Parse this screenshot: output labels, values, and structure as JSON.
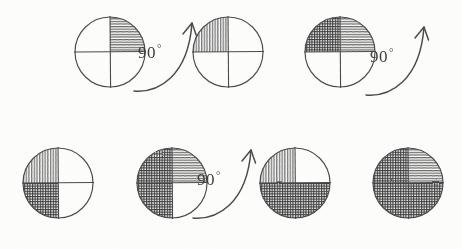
{
  "figure": {
    "background_color": "#fdfdfc",
    "ink_color": "#4a4a4a",
    "shading_dark_color": "#3a3a3a",
    "shading_light_color": "#6e6e6e",
    "media": "pencil sketch on paper",
    "rotation_step": "90",
    "degree_symbol": "°",
    "rows": 2,
    "circle_count": 7,
    "arrow_count": 3
  },
  "circles": [
    {
      "id": "circle-1",
      "index": 1,
      "row": 1,
      "cx": 110,
      "cy": 52,
      "r": 35,
      "shaded_quadrants": [
        "upper-right"
      ],
      "shaded_count": 1,
      "quadrants": {
        "upper-left": {
          "filled": false,
          "texture": "none"
        },
        "upper-right": {
          "filled": true,
          "texture": "horizontal"
        },
        "lower-left": {
          "filled": false,
          "texture": "none"
        },
        "lower-right": {
          "filled": false,
          "texture": "none"
        }
      }
    },
    {
      "id": "circle-2",
      "index": 2,
      "row": 1,
      "cx": 228,
      "cy": 52,
      "r": 35,
      "shaded_quadrants": [
        "upper-left"
      ],
      "shaded_count": 1,
      "quadrants": {
        "upper-left": {
          "filled": true,
          "texture": "vertical"
        },
        "upper-right": {
          "filled": false,
          "texture": "none"
        },
        "lower-left": {
          "filled": false,
          "texture": "none"
        },
        "lower-right": {
          "filled": false,
          "texture": "none"
        }
      }
    },
    {
      "id": "circle-3",
      "index": 3,
      "row": 1,
      "cx": 340,
      "cy": 52,
      "r": 35,
      "shaded_quadrants": [
        "upper-left",
        "upper-right"
      ],
      "shaded_count": 2,
      "quadrants": {
        "upper-left": {
          "filled": true,
          "texture": "crosshatch"
        },
        "upper-right": {
          "filled": true,
          "texture": "horizontal"
        },
        "lower-left": {
          "filled": false,
          "texture": "none"
        },
        "lower-right": {
          "filled": false,
          "texture": "none"
        }
      }
    },
    {
      "id": "circle-4",
      "index": 4,
      "row": 2,
      "cx": 58,
      "cy": 183,
      "r": 35,
      "shaded_quadrants": [
        "upper-left",
        "lower-left"
      ],
      "shaded_count": 2,
      "quadrants": {
        "upper-left": {
          "filled": true,
          "texture": "vertical"
        },
        "upper-right": {
          "filled": false,
          "texture": "none"
        },
        "lower-left": {
          "filled": true,
          "texture": "crosshatch"
        },
        "lower-right": {
          "filled": false,
          "texture": "none"
        }
      }
    },
    {
      "id": "circle-5",
      "index": 5,
      "row": 2,
      "cx": 172,
      "cy": 183,
      "r": 35,
      "shaded_quadrants": [
        "upper-left",
        "upper-right",
        "lower-left"
      ],
      "shaded_count": 3,
      "quadrants": {
        "upper-left": {
          "filled": true,
          "texture": "crosshatch"
        },
        "upper-right": {
          "filled": true,
          "texture": "horizontal"
        },
        "lower-left": {
          "filled": true,
          "texture": "crosshatch"
        },
        "lower-right": {
          "filled": false,
          "texture": "none"
        }
      }
    },
    {
      "id": "circle-6",
      "index": 6,
      "row": 2,
      "cx": 295,
      "cy": 183,
      "r": 35,
      "shaded_quadrants": [
        "upper-left",
        "lower-left",
        "lower-right"
      ],
      "shaded_count": 3,
      "quadrants": {
        "upper-left": {
          "filled": true,
          "texture": "vertical"
        },
        "upper-right": {
          "filled": false,
          "texture": "none"
        },
        "lower-left": {
          "filled": true,
          "texture": "crosshatch"
        },
        "lower-right": {
          "filled": true,
          "texture": "crosshatch"
        }
      }
    },
    {
      "id": "circle-7",
      "index": 7,
      "row": 2,
      "cx": 408,
      "cy": 183,
      "r": 35,
      "shaded_quadrants": [
        "upper-left",
        "upper-right",
        "lower-left",
        "lower-right"
      ],
      "shaded_count": 4,
      "quadrants": {
        "upper-left": {
          "filled": true,
          "texture": "crosshatch"
        },
        "upper-right": {
          "filled": true,
          "texture": "horizontal"
        },
        "lower-left": {
          "filled": true,
          "texture": "crosshatch"
        },
        "lower-right": {
          "filled": true,
          "texture": "crosshatch"
        }
      }
    }
  ],
  "arrows": [
    {
      "id": "arrow-1",
      "after_circle": 1,
      "label_number": "90",
      "label_degree": "°",
      "label_x": 150,
      "label_y": 53,
      "direction": "counterclockwise-sweep-up-right"
    },
    {
      "id": "arrow-2",
      "after_circle": 3,
      "label_number": "90",
      "label_degree": "°",
      "label_x": 382,
      "label_y": 57,
      "direction": "counterclockwise-sweep-up-right"
    },
    {
      "id": "arrow-3",
      "after_circle": 5,
      "label_number": "90",
      "label_degree": "°",
      "label_x": 209,
      "label_y": 180,
      "direction": "counterclockwise-sweep-up-right"
    }
  ]
}
